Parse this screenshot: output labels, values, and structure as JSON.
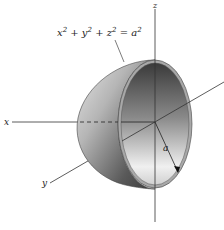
{
  "figure": {
    "type": "hemisphere-diagram",
    "equation": {
      "base": [
        "x",
        "y",
        "z",
        "a"
      ],
      "text": "x² + y² + z² = a²",
      "parts": [
        {
          "v": "x",
          "e": "2"
        },
        {
          "op": " + "
        },
        {
          "v": "y",
          "e": "2"
        },
        {
          "op": " + "
        },
        {
          "v": "z",
          "e": "2"
        },
        {
          "op": " = "
        },
        {
          "v": "a",
          "e": "2"
        }
      ]
    },
    "axes": {
      "x_label": "x",
      "y_label": "y",
      "z_label": "z"
    },
    "radius_label": "a",
    "colors": {
      "axis": "#333333",
      "shell_dark": "#4a4a4a",
      "shell_light": "#d8d8d8",
      "inner_dark": "#3c3c3c",
      "inner_light": "#f2f2f2",
      "rim": "#9a9a9a"
    }
  }
}
